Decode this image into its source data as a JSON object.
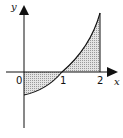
{
  "diagram": {
    "axes": {
      "x_label": "x",
      "y_label": "y",
      "ticks": [
        {
          "label": "0",
          "value": 0
        },
        {
          "label": "1",
          "value": 1
        },
        {
          "label": "2",
          "value": 2
        }
      ]
    },
    "curve": {
      "passes_through": [
        [
          0,
          -0.6
        ],
        [
          1,
          0
        ],
        [
          2,
          1.55
        ]
      ],
      "shape": "increasing, concave up"
    },
    "shaded_regions": [
      {
        "from": 0,
        "to": 1,
        "position": "below x-axis"
      },
      {
        "from": 1,
        "to": 2,
        "position": "above x-axis"
      }
    ],
    "colors": {
      "stroke": "#111111",
      "fill": "#c8c8c8"
    }
  }
}
